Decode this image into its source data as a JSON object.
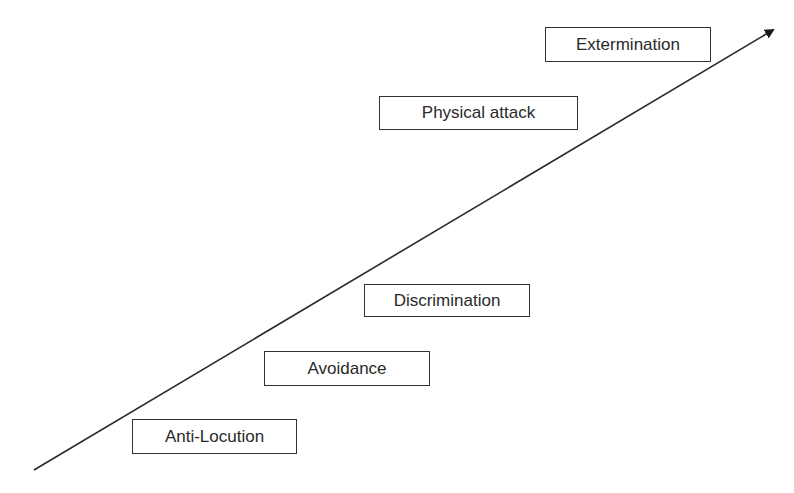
{
  "diagram": {
    "type": "escalation-scale",
    "arrow": {
      "start": [
        34,
        470
      ],
      "end": [
        775,
        28
      ],
      "color": "#2a2a2a"
    },
    "stages": [
      {
        "label": "Anti-Locution",
        "x": 132,
        "y": 419,
        "w": 165,
        "h": 35
      },
      {
        "label": "Avoidance",
        "x": 264,
        "y": 351,
        "w": 166,
        "h": 35
      },
      {
        "label": "Discrimination",
        "x": 364,
        "y": 284,
        "w": 166,
        "h": 33
      },
      {
        "label": "Physical attack",
        "x": 379,
        "y": 96,
        "w": 199,
        "h": 34
      },
      {
        "label": "Extermination",
        "x": 545,
        "y": 27,
        "w": 166,
        "h": 35
      }
    ]
  }
}
